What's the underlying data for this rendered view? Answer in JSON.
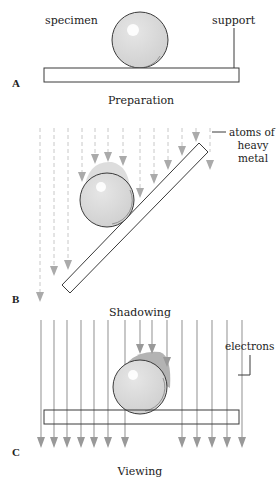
{
  "panels": {
    "a": {
      "letter": "A",
      "caption": "Preparation",
      "labels": {
        "specimen": "specimen",
        "support": "support"
      }
    },
    "b": {
      "letter": "B",
      "caption": "Shadowing",
      "labels": {
        "atoms_line1": "atoms of",
        "atoms_line2": "heavy",
        "atoms_line3": "metal"
      }
    },
    "c": {
      "letter": "C",
      "caption": "Viewing",
      "labels": {
        "electrons": "electrons"
      }
    }
  },
  "colors": {
    "outline": "#3a3a3a",
    "sphere_fill": "#d9d9d9",
    "arrow_gray": "#999999",
    "dashed_gray": "#c8c8c8",
    "shadow_metal": "#b8b8b8"
  }
}
